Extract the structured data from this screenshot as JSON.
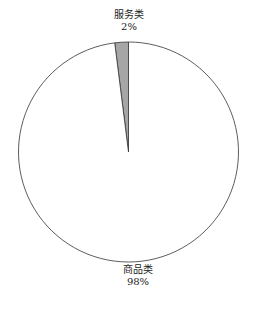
{
  "chart_data": {
    "type": "pie",
    "title": "",
    "categories": [
      "服务类",
      "商品类"
    ],
    "values": [
      2,
      98
    ],
    "labels": [
      {
        "name": "服务类",
        "percent": "2%"
      },
      {
        "name": "商品类",
        "percent": "98%"
      }
    ],
    "colors": [
      "#a6a6a6",
      "#ffffff"
    ],
    "edge_color": "#333333",
    "start_angle": "12 o'clock, counter-clockwise",
    "legend": "none (direct labels)"
  }
}
